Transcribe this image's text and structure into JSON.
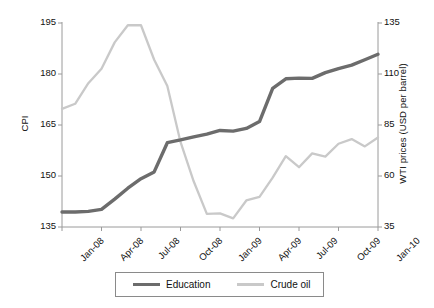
{
  "chart_data": {
    "type": "line",
    "title": "",
    "xlabel": "",
    "ylabel": "CPI",
    "y2label": "WTI prices (USD per barrel)",
    "grid": false,
    "legend_position": "bottom-center",
    "ylim": [
      135,
      195
    ],
    "y2lim": [
      35,
      135
    ],
    "yticks": [
      135,
      150,
      165,
      180,
      195
    ],
    "y2ticks": [
      35,
      60,
      85,
      110,
      135
    ],
    "x": [
      "Jan-08",
      "Feb-08",
      "Mar-08",
      "Apr-08",
      "May-08",
      "Jun-08",
      "Jul-08",
      "Aug-08",
      "Sep-08",
      "Oct-08",
      "Nov-08",
      "Dec-08",
      "Jan-09",
      "Feb-09",
      "Mar-09",
      "Apr-09",
      "May-09",
      "Jun-09",
      "Jul-09",
      "Aug-09",
      "Sep-09",
      "Oct-09",
      "Nov-09",
      "Dec-09",
      "Jan-10"
    ],
    "xtick_labels": [
      "Jan-08",
      "Apr-08",
      "Jul-08",
      "Oct-08",
      "Jan-09",
      "Apr-09",
      "Jul-09",
      "Oct-09",
      "Jan-10"
    ],
    "series": [
      {
        "name": "Education",
        "axis": "left",
        "color": "#6c6c6c",
        "width": 3.4,
        "values": [
          139.4,
          139.4,
          139.6,
          140.2,
          143.2,
          146.4,
          149.2,
          151.2,
          159.8,
          160.6,
          161.5,
          162.3,
          163.4,
          163.2,
          164.0,
          166.0,
          175.8,
          178.6,
          178.8,
          178.7,
          180.4,
          181.6,
          182.6,
          184.2,
          185.8
        ]
      },
      {
        "name": "Crude oil",
        "axis": "right",
        "color": "#c9c9c9",
        "width": 2.3,
        "values": [
          92.9,
          95.4,
          105.5,
          112.6,
          125.5,
          133.9,
          133.9,
          117.0,
          104.1,
          76.7,
          57.4,
          41.4,
          41.7,
          39.2,
          48.0,
          49.8,
          59.2,
          69.7,
          64.3,
          71.1,
          69.5,
          75.8,
          78.1,
          74.5,
          78.9
        ]
      }
    ]
  },
  "legend": {
    "education_label": "Education",
    "crude_label": "Crude oil"
  }
}
